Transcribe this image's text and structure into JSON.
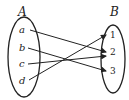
{
  "diagram": {
    "set_a": {
      "label": "A",
      "elements": [
        "a",
        "b",
        "c",
        "d"
      ]
    },
    "set_b": {
      "label": "B",
      "elements": [
        "1",
        "2",
        "3"
      ]
    },
    "mappings": [
      {
        "from": "a",
        "to": "2"
      },
      {
        "from": "b",
        "to": "3"
      },
      {
        "from": "c",
        "to": "2"
      },
      {
        "from": "d",
        "to": "1"
      }
    ]
  }
}
